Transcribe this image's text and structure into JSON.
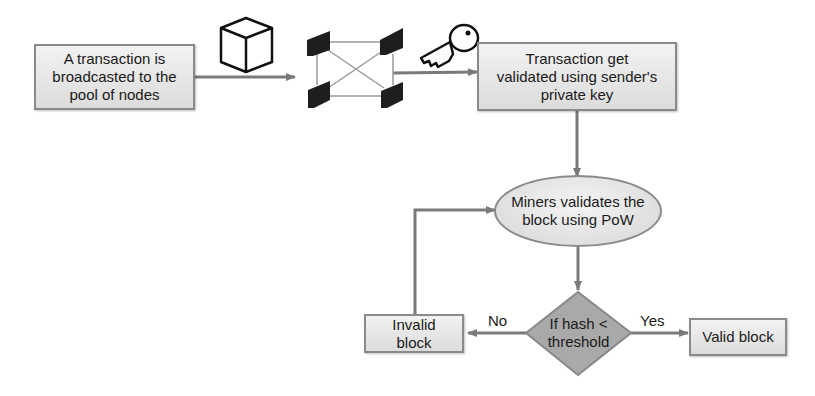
{
  "diagram": {
    "type": "flowchart",
    "nodes": {
      "broadcast": {
        "label": "A transaction is\nbroadcasted to the\npool of nodes",
        "shape": "rectangle"
      },
      "validate_key": {
        "label": "Transaction get\nvalidated using sender's\nprivate key",
        "shape": "rectangle"
      },
      "miners": {
        "label": "Miners validates the\nblock using PoW",
        "shape": "ellipse"
      },
      "decision": {
        "label": "If hash <\nthreshold",
        "shape": "diamond"
      },
      "invalid": {
        "label": "Invalid\nblock",
        "shape": "rectangle"
      },
      "valid": {
        "label": "Valid block",
        "shape": "rectangle"
      }
    },
    "icons": [
      "cube-icon",
      "node-network-icon",
      "key-icon"
    ],
    "edges": [
      {
        "from": "broadcast",
        "to": "node-network",
        "label": ""
      },
      {
        "from": "node-network",
        "to": "validate_key",
        "label": ""
      },
      {
        "from": "validate_key",
        "to": "miners",
        "label": ""
      },
      {
        "from": "miners",
        "to": "decision",
        "label": ""
      },
      {
        "from": "decision",
        "to": "invalid",
        "label": "No"
      },
      {
        "from": "decision",
        "to": "valid",
        "label": "Yes"
      },
      {
        "from": "invalid",
        "to": "miners",
        "label": ""
      }
    ],
    "edge_labels": {
      "no": "No",
      "yes": "Yes"
    },
    "colors": {
      "box_fill": "#e6e6e6",
      "border": "#8a8a8a",
      "diamond_fill": "#a9a9a9",
      "arrow": "#7a7a7a"
    }
  }
}
